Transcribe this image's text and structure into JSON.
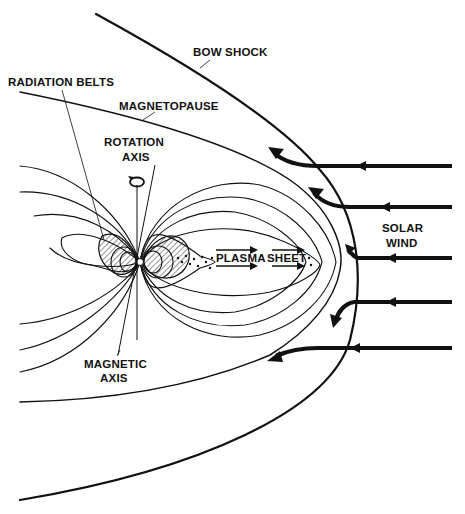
{
  "labels": {
    "bow_shock": "BOW SHOCK",
    "radiation_belts": "RADIATION BELTS",
    "magnetopause": "MAGNETOPAUSE",
    "rotation_axis_line1": "ROTATION",
    "rotation_axis_line2": "AXIS",
    "plasma_sheet_word1": "PLASMA",
    "plasma_sheet_word2": "SHEET",
    "solar_wind_line1": "SOLAR",
    "solar_wind_line2": "WIND",
    "magnetic_axis_line1": "MAGNETIC",
    "magnetic_axis_line2": "AXIS"
  },
  "elements": {
    "bow_shock": "outer parabolic boundary curve",
    "magnetopause": "inner parabolic boundary curve",
    "field_lines": "dipole magnetic field lines compressed on dayside, stretched on nightside",
    "radiation_belts": "hatched lobes around Earth",
    "plasma_sheet": "dotted region with rightward arrows in magnetotail",
    "solar_wind_arrows": 5,
    "rotation_axis_icon": "circular-arrow-icon"
  },
  "colors": {
    "ink": "#111111",
    "background": "#ffffff"
  }
}
